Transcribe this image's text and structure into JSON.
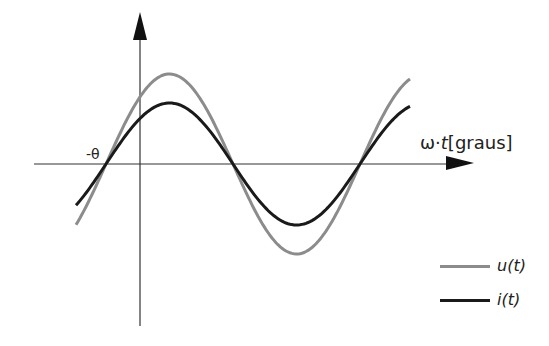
{
  "diagram": {
    "x_axis_label_prefix": "ω·",
    "x_axis_label_var": "t",
    "x_axis_label_unit": "[graus]",
    "phase_label": "-θ",
    "legend": [
      {
        "label": "u(t)",
        "color": "#8c8c8c"
      },
      {
        "label": "i(t)",
        "color": "#1a1a1a"
      }
    ]
  },
  "curves": {
    "u": {
      "name": "u(t)",
      "amplitude_px": 90,
      "color": "#8c8c8c"
    },
    "i": {
      "name": "i(t)",
      "amplitude_px": 61,
      "color": "#1a1a1a"
    },
    "zero_crossings_px": [
      106,
      233,
      360
    ],
    "axis_y_px": 164,
    "x_start_px": 76,
    "x_end_px": 410
  }
}
